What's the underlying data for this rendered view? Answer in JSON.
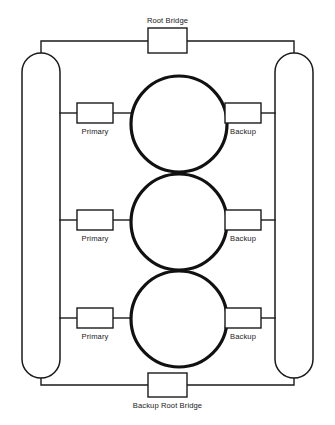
{
  "diagram": {
    "canvas": {
      "width": 335,
      "height": 425
    },
    "colors": {
      "background": "#ffffff",
      "line": "#1a1a1a",
      "ring": "#111111",
      "box_fill": "#ffffff",
      "text": "#1a1a1a"
    },
    "root_bridge": {
      "label": "Root Bridge",
      "label_position": "above",
      "box": {
        "x": 148,
        "y": 28,
        "width": 39,
        "height": 25
      }
    },
    "backup_root_bridge": {
      "label": "Backup Root Bridge",
      "label_position": "below",
      "box": {
        "x": 148,
        "y": 373,
        "width": 39,
        "height": 24
      }
    },
    "top_bus": {
      "y": 41,
      "x1": 44,
      "x2": 295
    },
    "bottom_bus": {
      "y": 385,
      "x1": 44,
      "x2": 295
    },
    "left_trunk": {
      "name": "left-backbone",
      "shape": "stadium",
      "x": 22,
      "y": 53,
      "width": 38,
      "height": 325,
      "radius": 19
    },
    "right_trunk": {
      "name": "right-backbone",
      "shape": "stadium",
      "x": 275,
      "y": 53,
      "width": 38,
      "height": 325,
      "radius": 19
    },
    "rings": [
      {
        "cx": 179,
        "cy": 124,
        "r": 48
      },
      {
        "cx": 179,
        "cy": 222,
        "r": 48
      },
      {
        "cx": 179,
        "cy": 319,
        "r": 48
      }
    ],
    "primary_bridges": [
      {
        "label": "Primary",
        "box": {
          "x": 77,
          "y": 103,
          "width": 36,
          "height": 20
        },
        "label_position": "below"
      },
      {
        "label": "Primary",
        "box": {
          "x": 77,
          "y": 210,
          "width": 36,
          "height": 20
        },
        "label_position": "below"
      },
      {
        "label": "Primary",
        "box": {
          "x": 77,
          "y": 308,
          "width": 36,
          "height": 20
        },
        "label_position": "below"
      }
    ],
    "backup_bridges": [
      {
        "label": "Backup",
        "box": {
          "x": 225,
          "y": 103,
          "width": 36,
          "height": 20
        },
        "label_position": "below"
      },
      {
        "label": "Backup",
        "box": {
          "x": 225,
          "y": 210,
          "width": 36,
          "height": 20
        },
        "label_position": "below"
      },
      {
        "label": "Backup",
        "box": {
          "x": 225,
          "y": 308,
          "width": 36,
          "height": 20
        },
        "label_position": "below"
      }
    ]
  }
}
